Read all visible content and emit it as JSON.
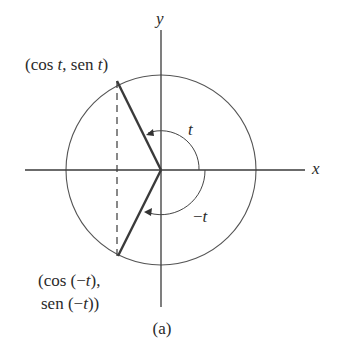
{
  "figure": {
    "caption": "(a)",
    "axes": {
      "x_label": "x",
      "y_label": "y"
    },
    "point_upper": {
      "label": "(cos t, sen t)",
      "parts": [
        "(cos ",
        "t",
        ", sen ",
        "t",
        ")"
      ]
    },
    "point_lower": {
      "label_line1": "(cos (−t),",
      "label_line2": "sen (−t))",
      "line1_parts": [
        "(cos (−",
        "t",
        "),"
      ],
      "line2_parts": [
        "sen (−",
        "t",
        "))"
      ]
    },
    "angle_positive": {
      "label": "t"
    },
    "angle_negative": {
      "label": "−t"
    },
    "colors": {
      "stroke": "#3a3a3a",
      "circle": "#555555",
      "text": "#2a2a2a"
    }
  }
}
